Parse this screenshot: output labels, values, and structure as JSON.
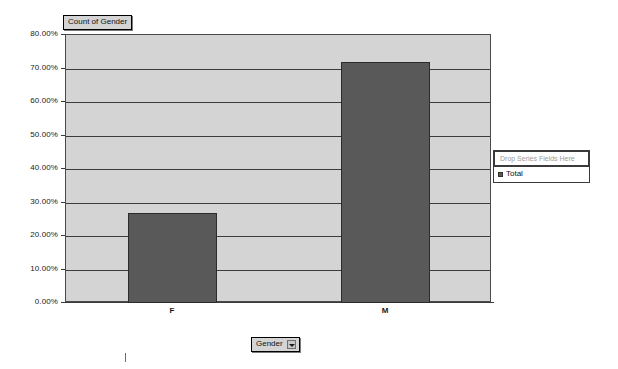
{
  "chart_data": {
    "type": "bar",
    "title": "Count of Gender",
    "categories": [
      "F",
      "M"
    ],
    "values": [
      27,
      72
    ],
    "value_suffix": "%",
    "series": [
      {
        "name": "Total",
        "values": [
          27,
          72
        ]
      }
    ],
    "xlabel": "Gender",
    "ylabel": "",
    "ylim": [
      0,
      80
    ],
    "ytick_step": 10,
    "yticks": [
      0,
      10,
      20,
      30,
      40,
      50,
      60,
      70,
      80
    ],
    "ytick_labels": [
      "0.00%",
      "10.00%",
      "20.00%",
      "30.00%",
      "40.00%",
      "50.00%",
      "60.00%",
      "70.00%",
      "80.00%"
    ],
    "grid": true,
    "legend_position": "right",
    "colors": {
      "bar_fill": "#595959",
      "bar_border": "#2b2b2b",
      "plot_background": "#d4d4d4",
      "axis": "#3c3c3c",
      "gridline": "#3c3c3c",
      "page_background": "#ffffff",
      "title_background": "#d4d4d4",
      "placeholder_text": "#9b9b9b"
    }
  },
  "legend": {
    "drop_series_placeholder": "Drop Series Fields Here",
    "items": [
      {
        "label": "Total"
      }
    ]
  },
  "field_buttons": {
    "category_field": {
      "label": "Gender",
      "dropdown_icon": "chevron-down-icon"
    }
  }
}
